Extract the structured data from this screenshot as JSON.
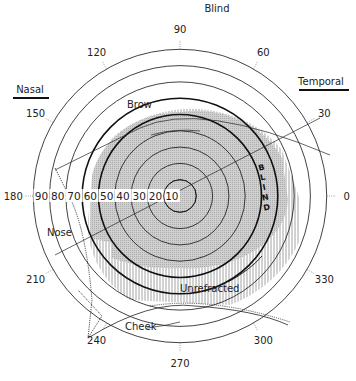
{
  "diagram": {
    "type": "visual field perimetry chart",
    "center": {
      "x": 180,
      "y": 196
    },
    "degrees_per_ring": 10,
    "px_per_10deg": 16.3,
    "rings": [
      10,
      20,
      30,
      40,
      50,
      60,
      70,
      80,
      90
    ],
    "bold_rings": [
      50,
      60
    ],
    "ring_labels": [
      "90",
      "80",
      "70",
      "60",
      "50",
      "40",
      "30",
      "20",
      "10"
    ],
    "meridian_labels": [
      {
        "angle": 90,
        "text": "90"
      },
      {
        "angle": 60,
        "text": "60"
      },
      {
        "angle": 30,
        "text": "30"
      },
      {
        "angle": 0,
        "text": "0"
      },
      {
        "angle": 330,
        "text": "330"
      },
      {
        "angle": 300,
        "text": "300"
      },
      {
        "angle": 270,
        "text": "270"
      },
      {
        "angle": 240,
        "text": "240"
      },
      {
        "angle": 210,
        "text": "210"
      },
      {
        "angle": 180,
        "text": "180"
      },
      {
        "angle": 150,
        "text": "150"
      },
      {
        "angle": 120,
        "text": "120"
      }
    ],
    "headers": {
      "top": "Blind",
      "left": "Nasal",
      "right": "Temporal"
    },
    "annotations": {
      "brow": "Brow",
      "nose": "Nose",
      "cheek": "Cheek",
      "unrefracted": "Unrefracted",
      "blind": [
        "B",
        "L",
        "I",
        "N",
        "D"
      ]
    },
    "colors": {
      "line": "#111111",
      "shade_dense": "#bdbdbd",
      "hatch": "#9a9a9a"
    }
  }
}
